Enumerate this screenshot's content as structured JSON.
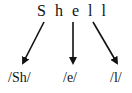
{
  "diagram": {
    "word": {
      "letters": [
        "S",
        "h",
        "e",
        "l",
        "l"
      ],
      "text": "Shell"
    },
    "phonemes": [
      {
        "label": "/Sh/",
        "source_letters": "Sh"
      },
      {
        "label": "/e/",
        "source_letters": "e"
      },
      {
        "label": "/l/",
        "source_letters": "ll"
      }
    ],
    "colors": {
      "text": "#111111",
      "arrow": "#111111",
      "background": "#ffffff"
    }
  }
}
